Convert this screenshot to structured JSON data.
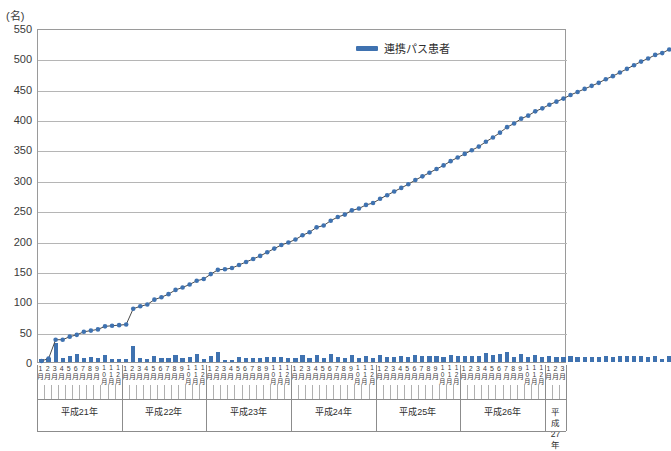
{
  "chart_data": {
    "type": "line",
    "title": "",
    "subtitle": "",
    "unit_label": "(名)",
    "xlabel": "",
    "ylabel": "",
    "ylim": [
      0,
      550
    ],
    "ytick_step": 50,
    "yticks": [
      "0",
      "50",
      "100",
      "150",
      "200",
      "250",
      "300",
      "350",
      "400",
      "450",
      "500",
      "550"
    ],
    "grid": true,
    "legend_position": "top-center",
    "legend": [
      "連携パス患者"
    ],
    "series": [
      {
        "name": "連携パス患者",
        "type": "line",
        "color": "#3f72b0",
        "values": [
          5,
          9,
          40,
          40,
          45,
          48,
          53,
          55,
          57,
          62,
          63,
          64,
          65,
          91,
          95,
          98,
          106,
          110,
          115,
          122,
          126,
          131,
          137,
          140,
          148,
          155,
          156,
          158,
          163,
          168,
          173,
          178,
          184,
          190,
          196,
          200,
          205,
          212,
          217,
          225,
          228,
          236,
          242,
          246,
          253,
          256,
          262,
          265,
          272,
          278,
          284,
          290,
          296,
          303,
          309,
          315,
          321,
          327,
          334,
          340,
          346,
          352,
          358,
          366,
          373,
          381,
          390,
          396,
          404,
          409,
          416,
          421,
          427,
          432,
          437,
          443,
          448,
          453,
          458,
          463,
          469,
          474,
          480,
          486,
          492,
          498,
          503,
          509,
          512,
          518
        ]
      },
      {
        "name": "月別新規患者",
        "type": "bar",
        "color": "#3f72b0",
        "values": [
          5,
          6,
          31,
          6,
          10,
          13,
          6,
          9,
          6,
          12,
          5,
          5,
          5,
          26,
          6,
          5,
          10,
          6,
          7,
          12,
          7,
          8,
          13,
          5,
          10,
          16,
          4,
          4,
          8,
          7,
          7,
          7,
          9,
          8,
          9,
          6,
          7,
          11,
          7,
          12,
          6,
          13,
          9,
          7,
          12,
          6,
          10,
          6,
          11,
          9,
          9,
          10,
          9,
          12,
          10,
          10,
          10,
          9,
          12,
          10,
          10,
          10,
          10,
          15,
          11,
          13,
          17,
          9,
          13,
          8,
          12,
          8,
          10,
          8,
          8,
          10,
          8,
          8,
          8,
          8,
          10,
          8,
          10,
          10,
          10,
          10,
          8,
          10,
          5,
          10
        ]
      }
    ],
    "months": [
      "1月",
      "2月",
      "3月",
      "4月",
      "5月",
      "6月",
      "7月",
      "8月",
      "9月",
      "10月",
      "11月",
      "12月"
    ],
    "year_groups": [
      {
        "label": "平成21年",
        "months": 12
      },
      {
        "label": "平成22年",
        "months": 12
      },
      {
        "label": "平成23年",
        "months": 12
      },
      {
        "label": "平成24年",
        "months": 12
      },
      {
        "label": "平成25年",
        "months": 12
      },
      {
        "label": "平成26年",
        "months": 12
      },
      {
        "label": "平成27年",
        "months": 3
      }
    ],
    "x_total_points": 75
  }
}
